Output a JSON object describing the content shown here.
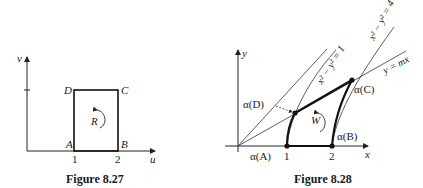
{
  "figure_left": {
    "caption": "Figure 8.27",
    "axis_x_label": "u",
    "axis_y_label": "v",
    "tick_labels": [
      "1",
      "2"
    ],
    "vertices": {
      "A": "A",
      "B": "B",
      "C": "C",
      "D": "D"
    },
    "region_label": "R"
  },
  "figure_right": {
    "caption": "Figure 8.28",
    "axis_x_label": "x",
    "axis_y_label": "y",
    "tick_labels": [
      "1",
      "2"
    ],
    "curve_labels": {
      "hyperbola_1": "x² − y² = 1",
      "hyperbola_4": "x² − y² = 4",
      "line": "y = mx"
    },
    "point_labels": {
      "A": "α(A)",
      "B": "α(B)",
      "C": "α(C)",
      "D": "α(D)"
    },
    "region_label": "W"
  }
}
